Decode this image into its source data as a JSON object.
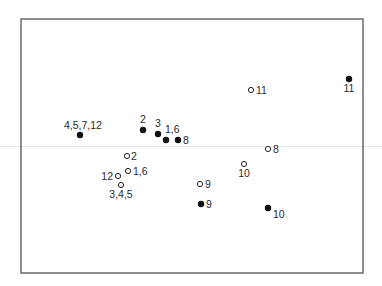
{
  "chart_data": {
    "type": "scatter",
    "title": "",
    "xlabel": "",
    "ylabel": "",
    "axes_visible": false,
    "grid": false,
    "legend": null,
    "frame": {
      "left": 21,
      "top": 19,
      "right": 363,
      "bottom": 273,
      "color": "#555555"
    },
    "series": [
      {
        "name": "filled",
        "marker": "filled-circle",
        "color": "#111111",
        "points": [
          {
            "label": "4,5,7,12",
            "px": 80,
            "py": 135,
            "lx": 64,
            "ly": 129,
            "anchor": "start"
          },
          {
            "label": "2",
            "px": 143,
            "py": 130,
            "lx": 143,
            "ly": 123,
            "anchor": "middle"
          },
          {
            "label": "3",
            "px": 158,
            "py": 134,
            "lx": 158,
            "ly": 127,
            "anchor": "middle"
          },
          {
            "label": "1,6",
            "px": 166,
            "py": 140,
            "lx": 165,
            "ly": 133,
            "anchor": "start"
          },
          {
            "label": "8",
            "px": 178,
            "py": 140,
            "lx": 183,
            "ly": 144,
            "anchor": "start"
          },
          {
            "label": "11",
            "px": 349,
            "py": 79,
            "lx": 349,
            "ly": 92,
            "anchor": "middle"
          },
          {
            "label": "9",
            "px": 201,
            "py": 204,
            "lx": 206,
            "ly": 208,
            "anchor": "start"
          },
          {
            "label": "10",
            "px": 268,
            "py": 208,
            "lx": 273,
            "ly": 218,
            "anchor": "start"
          }
        ]
      },
      {
        "name": "open",
        "marker": "open-circle",
        "color": "#222222",
        "points": [
          {
            "label": "2",
            "px": 127,
            "py": 156,
            "lx": 131,
            "ly": 160,
            "anchor": "start"
          },
          {
            "label": "1,6",
            "px": 128,
            "py": 171,
            "lx": 133,
            "ly": 175,
            "anchor": "start"
          },
          {
            "label": "12",
            "px": 118,
            "py": 176,
            "lx": 113,
            "ly": 180,
            "anchor": "end"
          },
          {
            "label": "3,4,5",
            "px": 121,
            "py": 185,
            "lx": 121,
            "ly": 198,
            "anchor": "middle"
          },
          {
            "label": "9",
            "px": 200,
            "py": 184,
            "lx": 205,
            "ly": 188,
            "anchor": "start"
          },
          {
            "label": "10",
            "px": 244,
            "py": 164,
            "lx": 244,
            "ly": 177,
            "anchor": "middle"
          },
          {
            "label": "8",
            "px": 268,
            "py": 149,
            "lx": 273,
            "ly": 153,
            "anchor": "start"
          },
          {
            "label": "11",
            "px": 251,
            "py": 90,
            "lx": 256,
            "ly": 94,
            "anchor": "start"
          }
        ]
      }
    ]
  }
}
